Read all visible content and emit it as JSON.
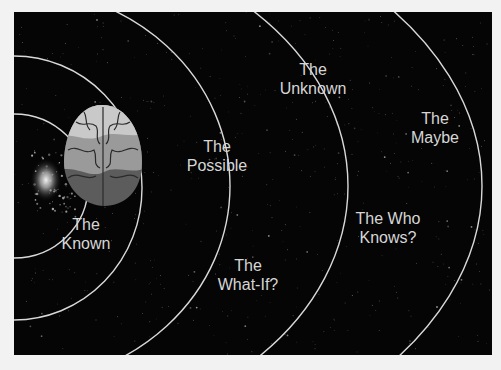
{
  "diagram": {
    "type": "concentric-zones",
    "center_object": "brain-illustration",
    "colors": {
      "background": "#050505",
      "page": "#f2f2f2",
      "ring": "#d9d9d9",
      "label": "#d6d6d6",
      "brain_light": "#c9c9c9",
      "brain_mid": "#9a9a9a",
      "brain_dark": "#5c5c5c"
    },
    "zones": [
      {
        "id": "known",
        "line1": "The",
        "line2": "Known",
        "x": 86,
        "y": 206
      },
      {
        "id": "possible",
        "line1": "The",
        "line2": "Possible",
        "x": 217,
        "y": 136
      },
      {
        "id": "whatif",
        "line1": "The",
        "line2": "What-If?",
        "x": 248,
        "y": 256
      },
      {
        "id": "unknown",
        "line1": "The",
        "line2": "Unknown",
        "x": 313,
        "y": 62
      },
      {
        "id": "whoknows",
        "line1": "The Who",
        "line2": "Knows?",
        "x": 388,
        "y": 209
      },
      {
        "id": "maybe",
        "line1": "The",
        "line2": "Maybe",
        "x": 435,
        "y": 109
      }
    ]
  }
}
